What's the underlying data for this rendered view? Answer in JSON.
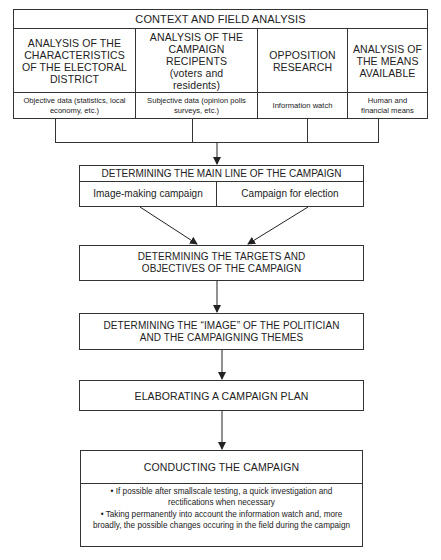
{
  "context_table": {
    "title": "CONTEXT AND FIELD ANALYSIS",
    "columns": [
      {
        "heading": "ANALYSIS OF THE CHARACTERISTICS OF THE ELECTORAL DISTRICT",
        "detail": "Objective data (statistics, local economy, etc.)"
      },
      {
        "heading": "ANALYSIS OF THE CAMPAIGN RECIPENTS",
        "heading_sub": "(voters and residents)",
        "detail": "Subjective data (opinion polls surveys, etc.)"
      },
      {
        "heading": "OPPOSITION RESEARCH",
        "detail": "Information watch"
      },
      {
        "heading": "ANALYSIS OF THE MEANS AVAILABLE",
        "detail": "Human and financial means"
      }
    ]
  },
  "main_line": {
    "title": "DETERMINING THE MAIN LINE OF THE CAMPAIGN",
    "options": [
      "Image-making campaign",
      "Campaign for election"
    ]
  },
  "steps": [
    {
      "title": "DETERMINING THE TARGETS AND OBJECTIVES OF THE CAMPAIGN"
    },
    {
      "title": "DETERMINING THE “IMAGE” OF THE POLITICIAN AND THE CAMPAIGNING THEMES"
    },
    {
      "title": "ELABORATING A CAMPAIGN PLAN"
    }
  ],
  "conducting": {
    "title": "CONDUCTING THE CAMPAIGN",
    "bullets": [
      "• If possible after smallscale testing, a quick investigation and rectifications when necessary",
      "• Taking permanently into account the information watch and, more broadly, the possible changes occuring in the field during the campaign"
    ]
  }
}
